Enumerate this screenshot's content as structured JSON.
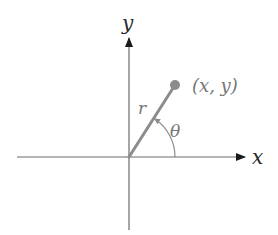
{
  "diagram": {
    "type": "polar-coordinates",
    "axes": {
      "x_label": "x",
      "y_label": "y",
      "axis_color": "#6b6b6b",
      "arrow_color": "#1a1a1a"
    },
    "point": {
      "label": "(x, y)",
      "color": "#8c8c8c"
    },
    "radius": {
      "label": "r",
      "color": "#8c8c8c"
    },
    "angle": {
      "label": "θ",
      "color": "#8c8c8c"
    },
    "label_colors": {
      "axis_labels": "#2a2a2a",
      "math_labels": "#777777"
    }
  }
}
